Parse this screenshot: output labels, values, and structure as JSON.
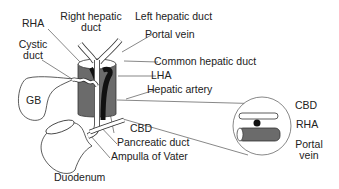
{
  "diagram": {
    "type": "anatomical",
    "colors": {
      "outline": "#333333",
      "vessel_fill": "#6b6b6b",
      "artery_fill": "#111111",
      "duct_fill": "#ffffff",
      "leader": "#555555"
    },
    "labels": {
      "rha": "RHA",
      "right_hepatic_duct_1": "Right hepatic",
      "right_hepatic_duct_2": "duct",
      "left_hepatic_duct": "Left hepatic duct",
      "portal_vein": "Portal vein",
      "cystic_duct_1": "Cystic",
      "cystic_duct_2": "duct",
      "common_hepatic_duct": "Common hepatic duct",
      "lha": "LHA",
      "hepatic_artery": "Hepatic artery",
      "gb": "GB",
      "cbd": "CBD",
      "pancreatic_duct": "Pancreatic duct",
      "ampulla": "Ampulla of Vater",
      "duodenum": "Duodenum"
    },
    "inset": {
      "cbd": "CBD",
      "rha": "RHA",
      "portal_vein_1": "Portal",
      "portal_vein_2": "vein"
    }
  }
}
